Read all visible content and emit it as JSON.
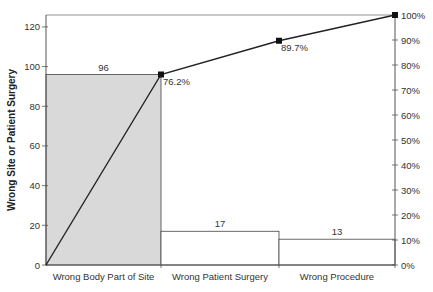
{
  "chart_data": {
    "type": "bar",
    "subtype": "pareto",
    "title": "",
    "categories": [
      "Wrong Body Part of Site",
      "Wrong Patient Surgery",
      "Wrong Procedure"
    ],
    "series": [
      {
        "name": "Count",
        "type": "bar",
        "values": [
          96,
          17,
          13
        ]
      },
      {
        "name": "Cumulative %",
        "type": "line",
        "values": [
          76.2,
          89.7,
          100.0
        ],
        "labels": [
          "76.2%",
          "89.7%",
          ""
        ]
      }
    ],
    "bar_labels": [
      "96",
      "17",
      "13"
    ],
    "xlabel": "",
    "ylabel": "Wrong Site or Patient Surgery",
    "ylim": [
      0,
      126
    ],
    "y_ticks": [
      0,
      20,
      40,
      60,
      80,
      100,
      120
    ],
    "y2label": "",
    "y2lim": [
      0,
      100
    ],
    "y2_ticks": [
      "0%",
      "10%",
      "20%",
      "30%",
      "40%",
      "50%",
      "60%",
      "70%",
      "80%",
      "90%",
      "100%"
    ],
    "grid": false,
    "legend": "none",
    "colors": {
      "highlight_bar": "#d9d9d9",
      "other_bars": "#ffffff",
      "line": "#222222",
      "axis": "#555555"
    }
  }
}
